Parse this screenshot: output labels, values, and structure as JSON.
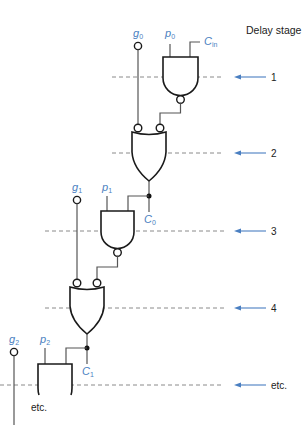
{
  "diagram": {
    "title": "Delay stage",
    "signals": {
      "g0": {
        "main": "g",
        "sub": "0"
      },
      "p0": {
        "main": "p",
        "sub": "0"
      },
      "cin": {
        "main": "C",
        "sub": "in"
      },
      "g1": {
        "main": "g",
        "sub": "1"
      },
      "p1": {
        "main": "p",
        "sub": "1"
      },
      "c0": {
        "main": "C",
        "sub": "0"
      },
      "g2": {
        "main": "g",
        "sub": "2"
      },
      "p2": {
        "main": "p",
        "sub": "2"
      },
      "c1": {
        "main": "C",
        "sub": "1"
      }
    },
    "stages": [
      {
        "label": "1",
        "y": 77
      },
      {
        "label": "2",
        "y": 153
      },
      {
        "label": "3",
        "y": 231
      },
      {
        "label": "4",
        "y": 308
      },
      {
        "label": "etc.",
        "y": 385
      }
    ],
    "bottom_note": "etc.",
    "colors": {
      "signal_label": "#4a7fc1",
      "arrow": "#4a7fc1",
      "gate_stroke": "#1a1a1a",
      "dashed_line": "#8a8a8a"
    },
    "gates": [
      {
        "id": "nand-0",
        "type": "NAND",
        "inputs": [
          "p0",
          "Cin"
        ],
        "stage": "1"
      },
      {
        "id": "or-0",
        "type": "OR (inverted inputs)",
        "inputs": [
          "g0",
          "nand-0"
        ],
        "output": "C0",
        "stage": "2"
      },
      {
        "id": "nand-1",
        "type": "NAND",
        "inputs": [
          "p1",
          "C0"
        ],
        "stage": "3"
      },
      {
        "id": "or-1",
        "type": "OR (inverted inputs)",
        "inputs": [
          "g1",
          "nand-1"
        ],
        "output": "C1",
        "stage": "4"
      },
      {
        "id": "nand-2",
        "type": "NAND",
        "inputs": [
          "p2",
          "C1"
        ],
        "stage": "etc."
      }
    ]
  }
}
